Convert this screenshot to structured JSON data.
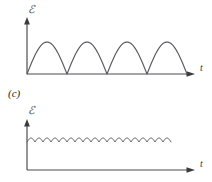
{
  "figure": {
    "panel_label": "(c)",
    "background_color": "#ffffff",
    "stroke_color": "#55555a",
    "axis_color": "#4d4d52"
  },
  "plots": [
    {
      "id": "full-wave-rectified",
      "y_axis_label": "ℰ",
      "x_axis_label": "t",
      "origin": {
        "x": 27,
        "y": 74
      },
      "x_axis_end": 196,
      "y_axis_top": 20,
      "chart_data": {
        "type": "line",
        "title": "",
        "xlabel": "t",
        "ylabel": "ℰ",
        "waveform": "full-wave rectified sine",
        "cycles": 4,
        "period_px": 40,
        "amplitude_px": 32,
        "baseline_value": 0,
        "peak_value": 1,
        "grid": false,
        "legend": false,
        "xlim": [
          0,
          169
        ],
        "ylim": [
          0,
          1
        ]
      }
    },
    {
      "id": "filtered-ripple",
      "y_axis_label": "ℰ",
      "x_axis_label": "t",
      "origin": {
        "x": 27,
        "y": 170
      },
      "x_axis_end": 196,
      "y_axis_top": 121,
      "chart_data": {
        "type": "line",
        "title": "",
        "xlabel": "t",
        "ylabel": "ℰ",
        "waveform": "smoothed ripple (filtered rectified output)",
        "cycles": 18,
        "period_px": 8,
        "amplitude_px": 4,
        "dc_level_px": 138,
        "ripple_end_x": 172,
        "grid": false,
        "legend": false,
        "xlim": [
          0,
          145
        ],
        "ylim": [
          0,
          1
        ]
      }
    }
  ]
}
